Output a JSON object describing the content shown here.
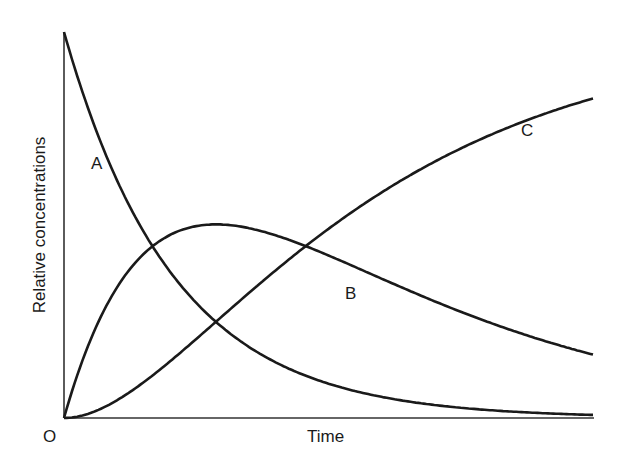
{
  "chart_data": {
    "type": "line",
    "title": "",
    "xlabel": "Time",
    "ylabel": "Relative concentrations",
    "origin_label": "O",
    "xlim": [
      0,
      1
    ],
    "ylim": [
      0,
      1
    ],
    "grid": false,
    "legend": "inline curve labels",
    "model": {
      "reaction": "A -> B -> C",
      "k1": 4.84,
      "k2": 2.4
    },
    "x": [
      0,
      0.05,
      0.1,
      0.15,
      0.2,
      0.25,
      0.3,
      0.35,
      0.4,
      0.45,
      0.5,
      0.55,
      0.6,
      0.65,
      0.7,
      0.75,
      0.8,
      0.85,
      0.9,
      0.95,
      1.0
    ],
    "series": [
      {
        "name": "A",
        "values": [
          1.0,
          0.785,
          0.616,
          0.484,
          0.38,
          0.298,
          0.234,
          0.184,
          0.144,
          0.113,
          0.089,
          0.07,
          0.055,
          0.043,
          0.034,
          0.027,
          0.021,
          0.016,
          0.013,
          0.01,
          0.008
        ]
      },
      {
        "name": "B",
        "values": [
          0.0,
          0.205,
          0.34,
          0.423,
          0.468,
          0.489,
          0.494,
          0.486,
          0.47,
          0.448,
          0.424,
          0.397,
          0.369,
          0.341,
          0.314,
          0.288,
          0.263,
          0.24,
          0.218,
          0.197,
          0.164
        ]
      },
      {
        "name": "C",
        "values": [
          0.0,
          0.01,
          0.044,
          0.093,
          0.152,
          0.213,
          0.272,
          0.33,
          0.386,
          0.439,
          0.487,
          0.533,
          0.576,
          0.616,
          0.652,
          0.685,
          0.716,
          0.744,
          0.769,
          0.793,
          0.828
        ]
      }
    ],
    "annotations": [
      {
        "text": "A",
        "x": 0.07,
        "y": 0.66
      },
      {
        "text": "B",
        "x": 0.52,
        "y": 0.32
      },
      {
        "text": "C",
        "x": 0.875,
        "y": 0.74
      }
    ]
  }
}
